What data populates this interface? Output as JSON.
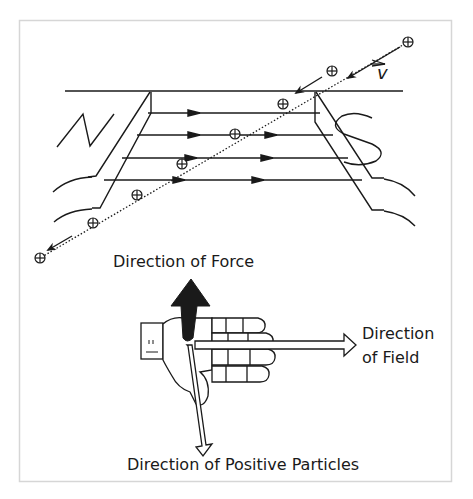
{
  "diagram": {
    "magnet": {
      "north_label": "N",
      "south_label": "S"
    },
    "velocity_label": "v",
    "particle_symbol": "⊕",
    "particle_count": 8,
    "field_line_count": 4,
    "labels": {
      "force": "Direction of Force",
      "field_line1": "Direction",
      "field_line2": "of Field",
      "particles": "Direction of Positive Particles"
    },
    "colors": {
      "ink": "#1a1a1a",
      "frame": "#d9d9d9",
      "background": "#ffffff"
    }
  }
}
